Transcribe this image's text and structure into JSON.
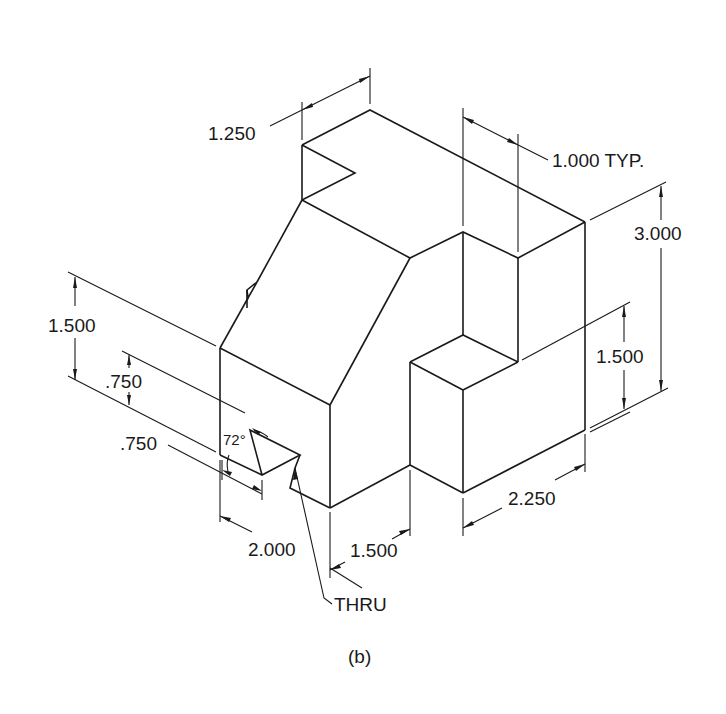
{
  "figure": {
    "caption": "(b)",
    "type": "isometric-dimensioned-drawing",
    "line_color": "#1a1a1a",
    "background": "#ffffff"
  },
  "dimensions": {
    "top_depth": "1.250",
    "typical_width": "1.000 TYP.",
    "overall_height": "3.000",
    "lower_step_height": "1.500",
    "left_height": "1.500",
    "notch_upper": ".750",
    "notch_lower": ".750",
    "notch_angle": "72°",
    "front_width_left": "2.000",
    "front_width_mid": "1.500",
    "right_width": "2.250",
    "thru_note": "THRU"
  }
}
